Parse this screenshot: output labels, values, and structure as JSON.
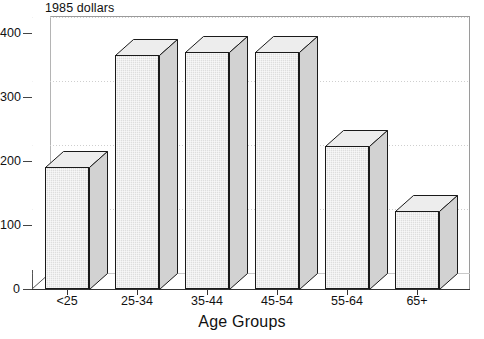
{
  "chart_data": {
    "type": "bar",
    "title": "1985 dollars",
    "subtitle": "",
    "xlabel": "Age Groups",
    "ylabel": "",
    "categories": [
      "<25",
      "25-34",
      "35-44",
      "45-54",
      "55-64",
      "65+"
    ],
    "values": [
      190,
      365,
      370,
      370,
      224,
      122
    ],
    "series": [
      {
        "name": "1985 dollars",
        "values": [
          190,
          365,
          370,
          370,
          224,
          122
        ]
      }
    ],
    "ylim": [
      0,
      400
    ],
    "ytick_labels": [
      "0",
      "100",
      "200",
      "300",
      "400"
    ],
    "ytick_values": [
      0,
      100,
      200,
      300,
      400
    ],
    "grid": "horizontal-dotted",
    "legend": "none",
    "style": "3d-bars",
    "bar_fill": "#dedede",
    "bar_outline": "#1a1a1a",
    "grid_color": "#cfcfcf",
    "axis_color": "#333333",
    "background": "#ffffff"
  },
  "labels": {
    "title": "1985 dollars",
    "axis_title_x": "Age Groups"
  }
}
